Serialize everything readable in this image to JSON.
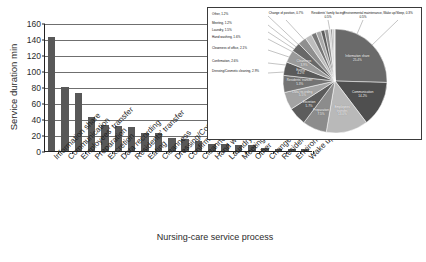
{
  "chart_data": {
    "type": "bar",
    "title": "",
    "xlabel": "Nursing-care service process",
    "ylabel": "Service duration  min",
    "ylim": [
      0,
      160
    ],
    "yticks": [
      0,
      20,
      40,
      60,
      80,
      100,
      120,
      140,
      160
    ],
    "grid": true,
    "legend": "none",
    "categories": [
      "Information share",
      "Communication",
      "Employees' transfer",
      "Preparation",
      "Excretion",
      "Data recording",
      "Residents' transfer",
      "Eating",
      "Cleanness",
      "Dressing/Cosmetic cleaning",
      "Confirmation",
      "Cleanness of office",
      "Hand washing",
      "Laundry",
      "Meeting",
      "Other",
      "Change of position",
      "Residents' family facing",
      "Environmental maintenance",
      "Wake up/Sleep"
    ],
    "values": [
      143,
      80,
      73,
      42,
      32,
      31,
      30,
      23,
      22,
      16,
      15,
      12,
      9,
      9,
      7,
      7,
      4,
      3,
      3,
      2
    ],
    "bar_color": "#585858"
  },
  "pie_data": {
    "type": "pie",
    "title": "",
    "labels": [
      "Information share",
      "Communication",
      "Employees' transfer",
      "Preparation",
      "Excretion",
      "Data recording",
      "Residents' transfer",
      "Eating",
      "Cleanness",
      "Dressing/Cosmetic cleaning",
      "Confirmation",
      "Cleanness of office",
      "Hand washing",
      "Laundry",
      "Meeting",
      "Other",
      "Change of position",
      "Residents' family facing",
      "Environmental maintenance",
      "Wake up/Sleep"
    ],
    "values": [
      25.4,
      14.2,
      13.0,
      7.5,
      5.7,
      5.5,
      5.3,
      4.2,
      3.9,
      2.9,
      2.6,
      2.1,
      1.6,
      1.5,
      1.2,
      1.2,
      0.7,
      0.5,
      0.5,
      0.3
    ],
    "inside_labels": [
      {
        "text": "Information share",
        "pct": "25.4%"
      },
      {
        "text": "Communication",
        "pct": "14.2%"
      },
      {
        "text": "Employees'",
        "pct": "13.0%",
        "text2": "transfer,"
      },
      {
        "text": "Preparation",
        "pct": "7.5%"
      },
      {
        "text": "Excretion",
        "pct": "5.7%"
      },
      {
        "text": "Data recording",
        "pct": "5.5%"
      },
      {
        "text": "Residents' transfer",
        "pct": "5.3%"
      },
      {
        "text": "Eating",
        "pct": "4.2%"
      },
      {
        "text": "Cleanness",
        "pct": "3.9%"
      }
    ],
    "callouts_left": [
      {
        "label": "Other",
        "pct": "1.2%"
      },
      {
        "label": "Meeting",
        "pct": "1.2%"
      },
      {
        "label": "Laundry",
        "pct": "1.5%"
      },
      {
        "label": "Hand washing",
        "pct": "1.6%"
      },
      {
        "label": "Cleanness of office",
        "pct": "2.1%"
      },
      {
        "label": "Confirmation",
        "pct": "2.6%"
      },
      {
        "label": "Dressing/Cosmetic cleaning",
        "pct": "2.9%"
      }
    ],
    "callouts_top": [
      {
        "label": "Change of position",
        "pct": "0.7%"
      },
      {
        "label": "Residents' family facing",
        "pct": "0.5%"
      },
      {
        "label": "Environmental maintenance",
        "pct": "0.5%"
      },
      {
        "label": "Wake up/Sleep",
        "pct": "0.3%"
      }
    ]
  }
}
